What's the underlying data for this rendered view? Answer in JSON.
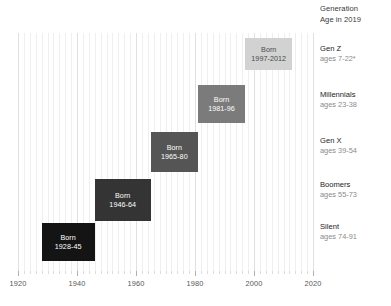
{
  "header": {
    "line1": "Generation",
    "line2": "Age in 2019"
  },
  "chart_data": {
    "type": "bar",
    "title": "",
    "xlabel": "",
    "ylabel": "",
    "xlim": [
      1920,
      2020
    ],
    "grid": true,
    "legend_position": "right",
    "axis_ticks": [
      1920,
      1940,
      1960,
      1980,
      2000,
      2020
    ],
    "tick_labels": [
      "1920",
      "1940",
      "1960",
      "1980",
      "2000",
      "2020"
    ],
    "minor_tick_step": 2,
    "categories": [
      "Silent",
      "Boomers",
      "Gen X",
      "Millennials",
      "Gen Z"
    ],
    "series": [
      {
        "name": "Birth year span",
        "values": [
          {
            "generation": "Silent",
            "start": 1928,
            "end": 1945,
            "label_line1": "Born",
            "label_line2": "1928-45",
            "color": "#141414",
            "ages": "74-91"
          },
          {
            "generation": "Boomers",
            "start": 1946,
            "end": 1964,
            "label_line1": "Born",
            "label_line2": "1946-64",
            "color": "#343434",
            "ages": "55-73"
          },
          {
            "generation": "Gen X",
            "start": 1965,
            "end": 1980,
            "label_line1": "Born",
            "label_line2": "1965-80",
            "color": "#555555",
            "ages": "39-54"
          },
          {
            "generation": "Millennials",
            "start": 1981,
            "end": 1996,
            "label_line1": "Born",
            "label_line2": "1981-96",
            "color": "#7b7b7b",
            "ages": "23-38"
          },
          {
            "generation": "Gen Z",
            "start": 1997,
            "end": 2012,
            "label_line1": "Born",
            "label_line2": "1997-2012",
            "color": "#d2d2d2",
            "ages": "7-22*"
          }
        ]
      }
    ]
  },
  "boxes": [
    {
      "l1": "Born",
      "l2": "1997-2012"
    },
    {
      "l1": "Born",
      "l2": "1981-96"
    },
    {
      "l1": "Born",
      "l2": "1965-80"
    },
    {
      "l1": "Born",
      "l2": "1946-64"
    },
    {
      "l1": "Born",
      "l2": "1928-45"
    }
  ],
  "generations": [
    {
      "name": "Gen Z",
      "ages": "ages 7-22*"
    },
    {
      "name": "Millennials",
      "ages": "ages 23-38"
    },
    {
      "name": "Gen X",
      "ages": "ages 39-54"
    },
    {
      "name": "Boomers",
      "ages": "ages 55-73"
    },
    {
      "name": "Silent",
      "ages": "ages 74-91"
    }
  ],
  "axis": {
    "labels": [
      "1920",
      "1940",
      "1960",
      "1980",
      "2000",
      "2020"
    ]
  }
}
